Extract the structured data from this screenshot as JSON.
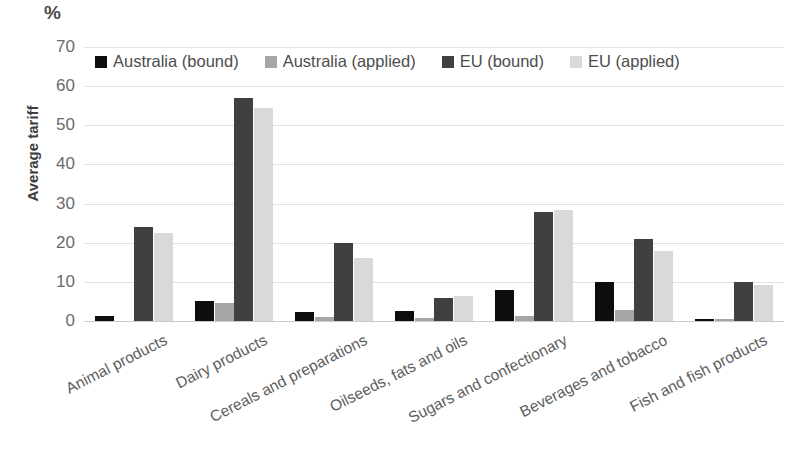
{
  "chart_data": {
    "type": "bar",
    "title": "",
    "subtitle": "",
    "unit_label": "%",
    "xlabel": "",
    "ylabel": "Average tariff",
    "ylim": [
      0,
      70
    ],
    "yticks": [
      0,
      10,
      20,
      30,
      40,
      50,
      60,
      70
    ],
    "grid": true,
    "legend_position": "top-inside",
    "categories": [
      "Animal products",
      "Dairy products",
      "Cereals and preparations",
      "Oilseeds, fats and oils",
      "Sugars and confectionary",
      "Beverages and tobacco",
      "Fish and fish products"
    ],
    "series": [
      {
        "name": "Australia (bound)",
        "color": "#0d0d0d",
        "values": [
          1.3,
          5.2,
          2.3,
          2.5,
          8.0,
          10.0,
          0.1
        ]
      },
      {
        "name": "Australia (applied)",
        "color": "#a6a6a6",
        "values": [
          0.0,
          4.5,
          1.0,
          0.8,
          1.3,
          2.8,
          0.3
        ]
      },
      {
        "name": "EU (bound)",
        "color": "#404040",
        "values": [
          24.0,
          57.0,
          20.0,
          6.0,
          27.8,
          21.0,
          10.0
        ]
      },
      {
        "name": "EU (applied)",
        "color": "#d9d9d9",
        "values": [
          22.5,
          54.5,
          16.0,
          6.3,
          28.3,
          18.0,
          9.3
        ]
      }
    ]
  }
}
